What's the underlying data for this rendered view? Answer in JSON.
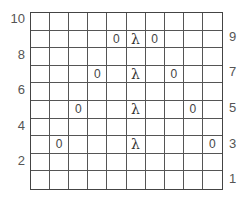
{
  "grid": {
    "rows": 10,
    "cols": 10,
    "cells": [
      {
        "row": 2,
        "col": 5,
        "text": "0"
      },
      {
        "row": 2,
        "col": 6,
        "text": "λ"
      },
      {
        "row": 2,
        "col": 7,
        "text": "0"
      },
      {
        "row": 4,
        "col": 4,
        "text": "0"
      },
      {
        "row": 4,
        "col": 6,
        "text": "λ"
      },
      {
        "row": 4,
        "col": 8,
        "text": "0"
      },
      {
        "row": 6,
        "col": 3,
        "text": "0"
      },
      {
        "row": 6,
        "col": 6,
        "text": "λ"
      },
      {
        "row": 6,
        "col": 9,
        "text": "0"
      },
      {
        "row": 8,
        "col": 2,
        "text": "0"
      },
      {
        "row": 8,
        "col": 6,
        "text": "λ"
      },
      {
        "row": 8,
        "col": 10,
        "text": "0"
      }
    ]
  },
  "left_labels": [
    {
      "row": 1,
      "text": "10"
    },
    {
      "row": 3,
      "text": "8"
    },
    {
      "row": 5,
      "text": "6"
    },
    {
      "row": 7,
      "text": "4"
    },
    {
      "row": 9,
      "text": "2"
    }
  ],
  "right_labels": [
    {
      "row": 2,
      "text": "9"
    },
    {
      "row": 4,
      "text": "7"
    },
    {
      "row": 6,
      "text": "5"
    },
    {
      "row": 8,
      "text": "3"
    },
    {
      "row": 10,
      "text": "1"
    }
  ]
}
